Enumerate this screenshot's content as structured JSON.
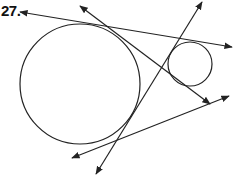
{
  "problem": {
    "number": "27."
  },
  "colors": {
    "stroke": "#222222",
    "background": "#ffffff"
  },
  "diagram": {
    "circles": [
      {
        "name": "large-circle",
        "cx": 80,
        "cy": 84,
        "r": 60
      },
      {
        "name": "small-circle",
        "cx": 190,
        "cy": 64,
        "r": 22
      }
    ],
    "lines": [
      {
        "name": "external-tangent-top",
        "x1": 20,
        "y1": 12,
        "x2": 232,
        "y2": 47,
        "arrows": "both"
      },
      {
        "name": "internal-tangent-1",
        "x1": 80,
        "y1": 6,
        "x2": 210,
        "y2": 104,
        "arrows": "both"
      },
      {
        "name": "internal-tangent-2",
        "x1": 202,
        "y1": 2,
        "x2": 96,
        "y2": 174,
        "arrows": "both"
      },
      {
        "name": "external-tangent-bottom",
        "x1": 72,
        "y1": 158,
        "x2": 229,
        "y2": 96,
        "arrows": "both"
      }
    ]
  }
}
